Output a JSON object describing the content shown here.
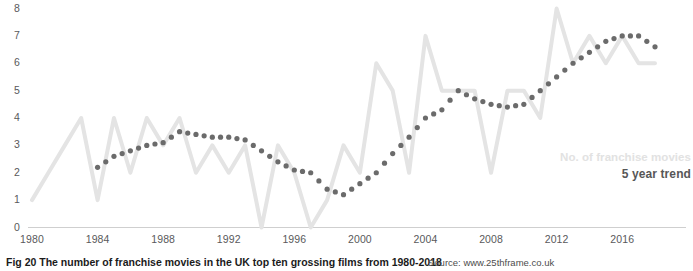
{
  "figure": {
    "caption": "Fig 20 The number of franchise movies in the UK top ten grossing films from 1980-2018",
    "source": "Source: www.25thframe.co.uk"
  },
  "legend": {
    "series_label": "No. of franchise movies",
    "trend_label": "5 year trend",
    "series_color": "#e4e4e4",
    "trend_color": "#6b6b6b"
  },
  "axes": {
    "y_ticks": [
      "8",
      "7",
      "6",
      "5",
      "4",
      "3",
      "2",
      "1",
      "0"
    ],
    "x_ticks": [
      "1980",
      "1984",
      "1988",
      "1992",
      "1996",
      "2000",
      "2004",
      "2008",
      "2012",
      "2016"
    ]
  },
  "chart_data": {
    "type": "line",
    "title": "Fig 20 The number of franchise movies in the UK top ten grossing films from 1980-2018",
    "xlabel": "",
    "ylabel": "",
    "ylim": [
      0,
      8
    ],
    "xlim": [
      1980,
      2018
    ],
    "grid": false,
    "legend_position": "right-inside",
    "x": [
      1980,
      1981,
      1982,
      1983,
      1984,
      1985,
      1986,
      1987,
      1988,
      1989,
      1990,
      1991,
      1992,
      1993,
      1994,
      1995,
      1996,
      1997,
      1998,
      1999,
      2000,
      2001,
      2002,
      2003,
      2004,
      2005,
      2006,
      2007,
      2008,
      2009,
      2010,
      2011,
      2012,
      2013,
      2014,
      2015,
      2016,
      2017,
      2018
    ],
    "series": [
      {
        "name": "No. of franchise movies",
        "type": "line",
        "color": "#e4e4e4",
        "values": [
          1,
          2,
          3,
          4,
          1,
          4,
          2,
          4,
          3,
          4,
          2,
          3,
          2,
          3,
          0,
          3,
          2,
          0,
          1,
          3,
          2,
          6,
          5,
          2,
          7,
          5,
          5,
          5,
          2,
          5,
          5,
          4,
          8,
          6,
          7,
          6,
          7,
          6,
          6
        ]
      },
      {
        "name": "5 year trend",
        "type": "dotted",
        "color": "#6b6b6b",
        "values": [
          null,
          null,
          null,
          null,
          2.2,
          2.6,
          2.8,
          3.0,
          3.1,
          3.5,
          3.4,
          3.3,
          3.3,
          3.2,
          2.8,
          2.4,
          2.1,
          2.0,
          1.4,
          1.2,
          1.6,
          2.0,
          2.7,
          3.3,
          4.0,
          4.3,
          5.0,
          4.7,
          4.5,
          4.4,
          4.5,
          5.0,
          5.5,
          6.0,
          6.4,
          6.8,
          7.0,
          7.0,
          6.6
        ]
      }
    ]
  }
}
